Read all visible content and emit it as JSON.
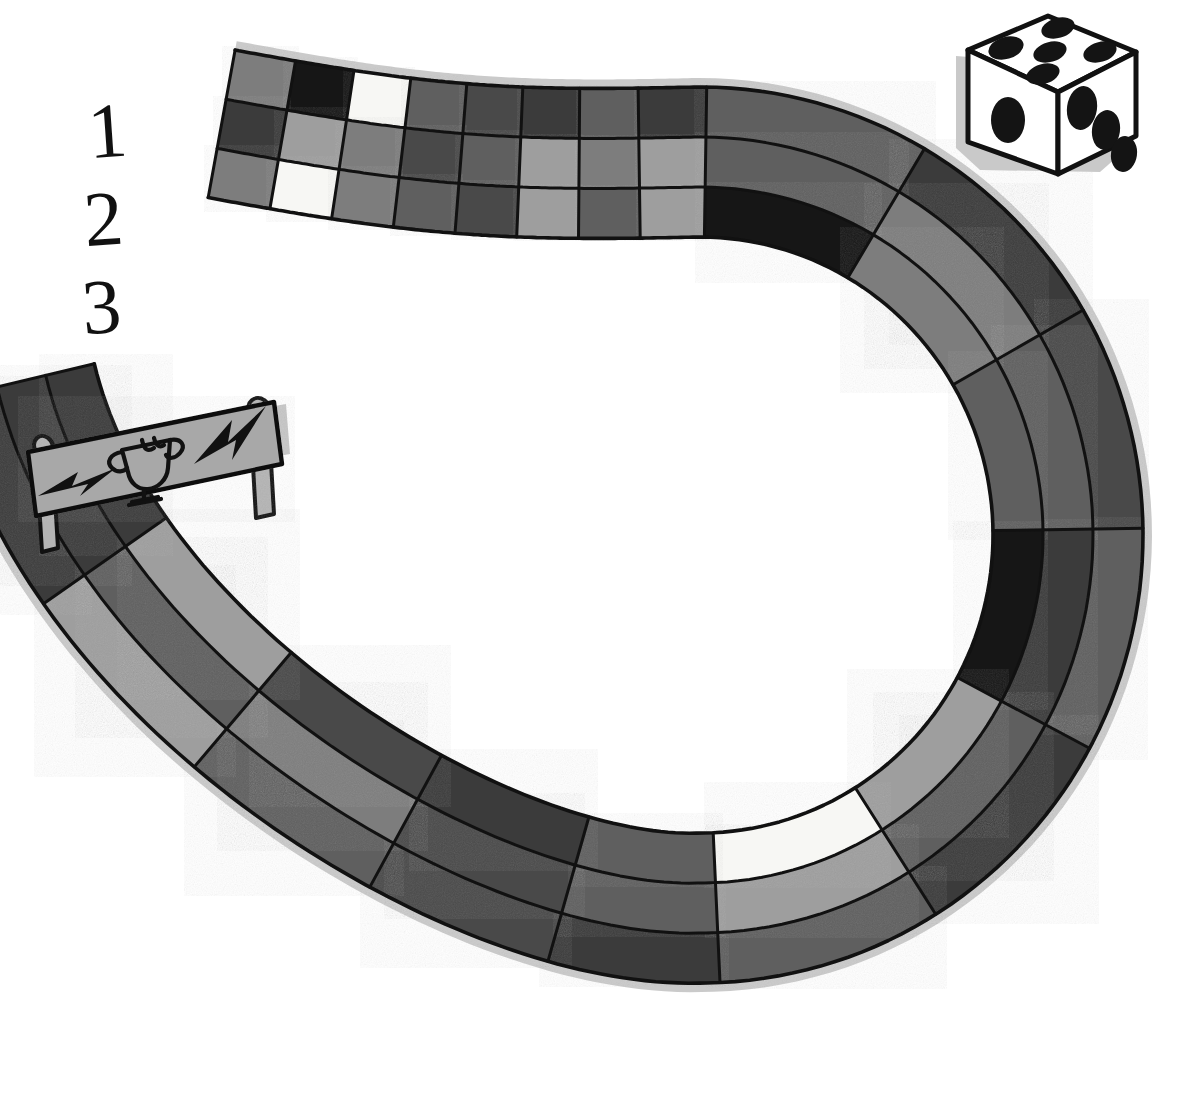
{
  "page": {
    "title_fragment": "",
    "background": "#ffffff",
    "width": 1196,
    "height": 1111,
    "style": "hand-drawn black-and-white board game illustration"
  },
  "lane_labels": {
    "name": "lane-numbers",
    "items": [
      "1",
      "2",
      "3"
    ],
    "description": "Hand-written numerals marking the three parallel race lanes at the track start"
  },
  "die": {
    "name": "six-sided-die",
    "top_face_pips": 5,
    "left_face_pips": 1,
    "right_face_pips": 3,
    "body_color": "#ffffff",
    "pip_color": "#111111",
    "outline_color": "#111111",
    "shadow_color": "#c9c9c9"
  },
  "sign": {
    "name": "finish-line-sign",
    "board_color": "#a8a8a8",
    "outline_color": "#111111",
    "post_color": "#b4b4b4",
    "shadow_color": "#c9c9c9",
    "icons": [
      "lightning-bolt-icon",
      "trophy-icon",
      "lightning-bolt-icon"
    ],
    "label": "Finish"
  },
  "track": {
    "name": "three-lane-race-track",
    "lane_count": 3,
    "lane_order_outer_to_inner": [
      "1",
      "2",
      "3"
    ],
    "outline_color": "#111111",
    "shadow_color": "#c7c7c7",
    "palette": {
      "white": "#f7f7f4",
      "light_gray": "#9e9e9e",
      "mid_gray": "#7d7d7d",
      "dark_gray": "#5f5f5f",
      "darker_gray": "#4a4a4a",
      "charcoal": "#3a3a3a",
      "black": "#141414"
    },
    "lanes": [
      {
        "lane": "1",
        "name": "outer-lane",
        "cells": [
          "mid_gray",
          "black",
          "white",
          "dark_gray",
          "darker_gray",
          "charcoal",
          "dark_gray",
          "charcoal",
          "dark_gray",
          "charcoal",
          "darker_gray",
          "dark_gray",
          "charcoal",
          "dark_gray",
          "charcoal",
          "darker_gray",
          "dark_gray",
          "light_gray",
          "charcoal"
        ]
      },
      {
        "lane": "2",
        "name": "middle-lane",
        "cells": [
          "charcoal",
          "light_gray",
          "mid_gray",
          "darker_gray",
          "dark_gray",
          "light_gray",
          "mid_gray",
          "light_gray",
          "dark_gray",
          "mid_gray",
          "dark_gray",
          "charcoal",
          "dark_gray",
          "light_gray",
          "dark_gray",
          "darker_gray",
          "mid_gray",
          "dark_gray",
          "charcoal"
        ]
      },
      {
        "lane": "3",
        "name": "inner-lane",
        "cells": [
          "mid_gray",
          "white",
          "mid_gray",
          "dark_gray",
          "darker_gray",
          "light_gray",
          "dark_gray",
          "light_gray",
          "black",
          "mid_gray",
          "dark_gray",
          "black",
          "light_gray",
          "white",
          "dark_gray",
          "charcoal",
          "darker_gray",
          "light_gray",
          "charcoal"
        ]
      }
    ]
  }
}
